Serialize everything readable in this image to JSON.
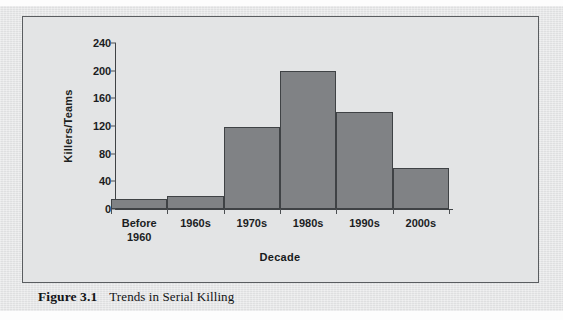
{
  "figure": {
    "caption_label": "Figure 3.1",
    "caption_text": "Trends in Serial Killing"
  },
  "colors": {
    "bar_fill": "#808285",
    "bar_stroke": "#3f4245",
    "plot_background": "#e3e4e5",
    "frame_border": "#5a5d60",
    "text": "#1b1d1f"
  },
  "chart_data": {
    "type": "bar",
    "title": "",
    "xlabel": "Decade",
    "ylabel": "Killers/Teams",
    "categories": [
      "Before 1960",
      "1960s",
      "1970s",
      "1980s",
      "1990s",
      "2000s"
    ],
    "category_lines": [
      [
        "Before",
        "1960"
      ],
      [
        "1960s"
      ],
      [
        "1970s"
      ],
      [
        "1980s"
      ],
      [
        "1990s"
      ],
      [
        "2000s"
      ]
    ],
    "values": [
      14,
      19,
      119,
      200,
      140,
      60
    ],
    "ylim": [
      0,
      240
    ],
    "yticks": [
      0,
      40,
      80,
      120,
      160,
      200,
      240
    ],
    "ytick_labels": [
      "0",
      "40",
      "80",
      "120",
      "160",
      "200",
      "240"
    ],
    "grid": false,
    "legend": null,
    "bar_gap": 0
  }
}
